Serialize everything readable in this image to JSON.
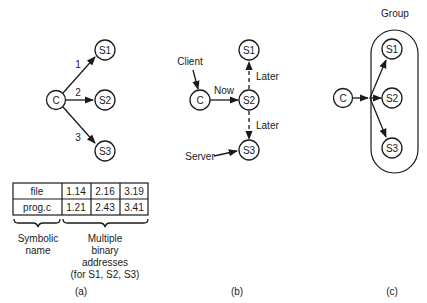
{
  "panel_a": {
    "client_label": "C",
    "servers": [
      "S1",
      "S2",
      "S3"
    ],
    "edge_labels": [
      "1",
      "2",
      "3"
    ],
    "table": {
      "rows": [
        {
          "name": "file",
          "addresses": [
            "1.14",
            "2.16",
            "3.19"
          ]
        },
        {
          "name": "prog.c",
          "addresses": [
            "1.21",
            "2.43",
            "3.41"
          ]
        }
      ]
    },
    "brace_left_label": [
      "Symbolic",
      "name"
    ],
    "brace_right_label": [
      "Multiple",
      "binary",
      "addresses",
      "(for S1, S2, S3)"
    ],
    "caption": "(a)"
  },
  "panel_b": {
    "client_label": "C",
    "servers": [
      "S1",
      "S2",
      "S3"
    ],
    "client_callout": "Client",
    "server_callout": "Server",
    "now_label": "Now",
    "later_up_label": "Later",
    "later_down_label": "Later",
    "caption": "(b)"
  },
  "panel_c": {
    "client_label": "C",
    "servers": [
      "S1",
      "S2",
      "S3"
    ],
    "group_label": "Group",
    "caption": "(c)"
  }
}
